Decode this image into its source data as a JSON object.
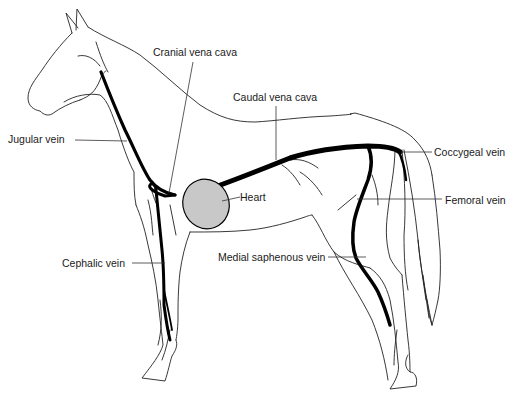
{
  "figure": {
    "colors": {
      "outline": "#222222",
      "vein": "#000000",
      "heart_fill": "#c8c8c8",
      "leader": "#333333",
      "background": "#ffffff"
    }
  },
  "labels": {
    "cranial_vena_cava": "Cranial vena cava",
    "caudal_vena_cava": "Caudal vena cava",
    "jugular_vein": "Jugular vein",
    "coccygeal_vein": "Coccygeal vein",
    "heart": "Heart",
    "femoral_vein": "Femoral vein",
    "cephalic_vein": "Cephalic vein",
    "medial_saphenous_vein": "Medial saphenous vein"
  }
}
